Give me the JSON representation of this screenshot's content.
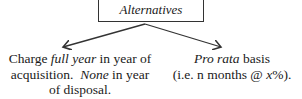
{
  "root": {
    "label": "Alternatives"
  },
  "branches": [
    {
      "parts": [
        {
          "text": "Charge ",
          "italic": false
        },
        {
          "text": "full year",
          "italic": true
        },
        {
          "text": " in year of acquisition.  ",
          "italic": false
        },
        {
          "text": "None",
          "italic": true
        },
        {
          "text": " in year of disposal.",
          "italic": false
        }
      ],
      "line1_a": "Charge ",
      "line1_b": "full year",
      "line1_c": " in year of",
      "line2_a": "acquisition.  ",
      "line2_b": "None",
      "line2_c": " in year",
      "line3": "of disposal."
    },
    {
      "line1_a": "Pro rata",
      "line1_b": " basis",
      "line2_a": "(i.e. n months @ ",
      "line2_b": "x",
      "line2_c": "%)."
    }
  ],
  "colors": {
    "line": "#333333",
    "text": "#1a1a1a"
  }
}
